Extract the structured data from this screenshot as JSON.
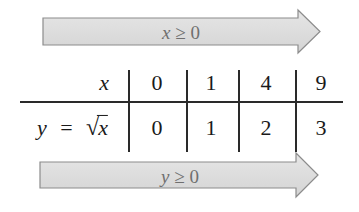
{
  "diagram": {
    "top_arrow": {
      "variable": "x",
      "relation": "≥",
      "bound": "0",
      "label": "x ≥ 0",
      "fill_color": "#dcdcdc",
      "stroke_color": "#8c8c8c",
      "text_color": "#6f6f6f"
    },
    "bottom_arrow": {
      "variable": "y",
      "relation": "≥",
      "bound": "0",
      "label": "y ≥ 0",
      "fill_color": "#dcdcdc",
      "stroke_color": "#8c8c8c",
      "text_color": "#6f6f6f"
    },
    "table": {
      "row1": {
        "label": "x",
        "values": [
          "0",
          "1",
          "4",
          "9"
        ]
      },
      "row2": {
        "label_lhs": "y",
        "label_eq": "=",
        "label_sqrt_arg": "x",
        "label": "y = √x",
        "values": [
          "0",
          "1",
          "2",
          "3"
        ]
      }
    }
  }
}
